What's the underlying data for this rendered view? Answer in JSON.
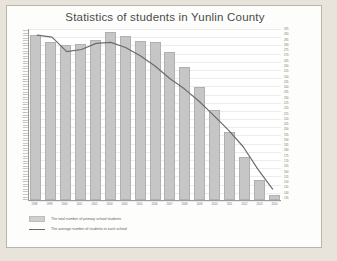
{
  "chart_data": {
    "type": "bar",
    "title": "Statistics of students in Yunlin County",
    "xlabel": "",
    "ylabel": "",
    "grid": true,
    "legend_position": "bottom-left",
    "categories": [
      "1998",
      "1999",
      "2000",
      "2001",
      "2002",
      "2003",
      "2004",
      "2005",
      "2006",
      "2007",
      "2008",
      "2009",
      "2010",
      "2011",
      "2012",
      "2013",
      "2014"
    ],
    "series": [
      {
        "name": "The total number of primary school students",
        "type": "bar",
        "axis": "left",
        "values": [
          98000,
          96500,
          96000,
          96200,
          97000,
          98500,
          97800,
          96800,
          96500,
          94500,
          91500,
          87500,
          83000,
          78500,
          73500,
          69000,
          66000
        ]
      },
      {
        "name": "The average number of students in each school",
        "type": "line",
        "axis": "right",
        "values": [
          292,
          290,
          276,
          278,
          284,
          285,
          280,
          272,
          262,
          250,
          240,
          228,
          214,
          200,
          184,
          162,
          143
        ]
      }
    ],
    "left_axis_ticks": [
      "98000",
      "97500",
      "97000",
      "96500",
      "96000",
      "95500",
      "95000",
      "94500",
      "94000",
      "93500",
      "93000",
      "92500",
      "92000",
      "91500",
      "91000",
      "90500",
      "90000",
      "89500",
      "89000",
      "88500",
      "88000",
      "87500",
      "87000",
      "86500",
      "86000",
      "85500",
      "85000",
      "84500",
      "84000",
      "83500",
      "83000",
      "82500",
      "82000",
      "81500",
      "81000",
      "80500",
      "80000",
      "79500",
      "79000",
      "78500",
      "78000",
      "77500",
      "77000",
      "76500",
      "76000",
      "75500",
      "75000",
      "74500",
      "74000",
      "73500",
      "73000",
      "72500",
      "72000",
      "71500",
      "71000",
      "70500",
      "70000",
      "69500",
      "69000",
      "68500",
      "68000",
      "67500",
      "67000",
      "66500",
      "66000",
      "65500",
      "65000"
    ],
    "right_axis_ticks": [
      "295",
      "290",
      "285",
      "280",
      "275",
      "270",
      "265",
      "260",
      "255",
      "250",
      "245",
      "240",
      "235",
      "230",
      "225",
      "220",
      "215",
      "210",
      "205",
      "200",
      "195",
      "190",
      "185",
      "180",
      "175",
      "170",
      "165",
      "160",
      "155",
      "150",
      "145",
      "140",
      "135"
    ],
    "ylim_left": [
      65000,
      98500
    ],
    "ylim_right": [
      135,
      295
    ]
  }
}
